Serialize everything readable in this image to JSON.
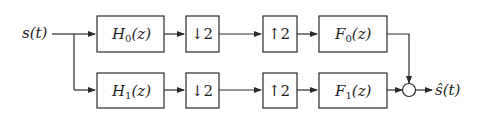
{
  "diagram": {
    "type": "two-channel filter bank",
    "input_label": "s(t)",
    "output_label": "ŝ(t)",
    "branches": [
      {
        "name": "branch-0",
        "analysis_filter": {
          "symbol": "H",
          "index": "0",
          "arg": "(z)"
        },
        "downsampler": "↓2",
        "upsampler": "↑2",
        "synthesis_filter": {
          "symbol": "F",
          "index": "0",
          "arg": "(z)"
        }
      },
      {
        "name": "branch-1",
        "analysis_filter": {
          "symbol": "H",
          "index": "1",
          "arg": "(z)"
        },
        "downsampler": "↓2",
        "upsampler": "↑2",
        "synthesis_filter": {
          "symbol": "F",
          "index": "1",
          "arg": "(z)"
        }
      }
    ],
    "summing_junction": "adder"
  }
}
